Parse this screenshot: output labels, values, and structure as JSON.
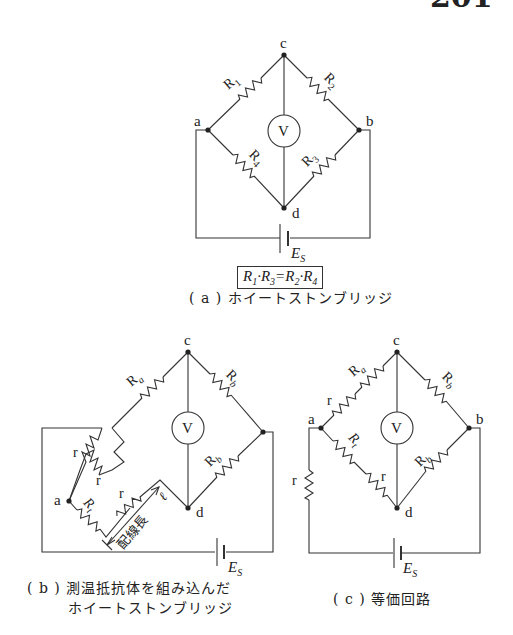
{
  "page": {
    "number": "201"
  },
  "diagram_a": {
    "nodes": {
      "c": "c",
      "a": "a",
      "b": "b",
      "d": "d"
    },
    "resistors": [
      "R1",
      "R2",
      "R3",
      "R4"
    ],
    "resistor_labels": {
      "r1": "R",
      "r1_sub": "1",
      "r2": "R",
      "r2_sub": "2",
      "r3": "R",
      "r3_sub": "3",
      "r4": "R",
      "r4_sub": "4"
    },
    "meter": "V",
    "source": {
      "label": "E",
      "sub": "S"
    },
    "equation": "R1·R3 = R2·R4",
    "equation_parts": {
      "l1": "R",
      "s1": "1",
      "l2": "R",
      "s2": "3",
      "eq": "=",
      "l3": "R",
      "s3": "2",
      "l4": "R",
      "s4": "4",
      "dot": "·"
    },
    "caption": "( a ) ホイートストンブリッジ"
  },
  "diagram_b": {
    "nodes": {
      "c": "c",
      "a": "a",
      "d": "d"
    },
    "resistor_labels": {
      "ra": "R",
      "ra_sub": "a",
      "rb_top": "R",
      "rb_top_sub": "b",
      "rb_bottom": "R",
      "rb_bottom_sub": "b",
      "rt": "R",
      "rt_sub": "t",
      "r1": "r",
      "r2": "r",
      "r3": "r"
    },
    "meter": "V",
    "wire_length_label": "配線長",
    "wire_length_symbol": "ℓ",
    "source": {
      "label": "E",
      "sub": "S"
    },
    "caption_line1": "( b ) 測温抵抗体を組み込んだ",
    "caption_line2": "ホイートストンブリッジ"
  },
  "diagram_c": {
    "nodes": {
      "c": "c",
      "a": "a",
      "b": "b",
      "d": "d"
    },
    "resistor_labels": {
      "ra": "R",
      "ra_sub": "a",
      "rb_top": "R",
      "rb_top_sub": "b",
      "rb_bottom": "R",
      "rb_bottom_sub": "b",
      "rt": "R",
      "rt_sub": "t",
      "r1": "r",
      "r2": "r",
      "r3": "r"
    },
    "meter": "V",
    "source": {
      "label": "E",
      "sub": "S"
    },
    "caption": "( c ) 等価回路"
  }
}
